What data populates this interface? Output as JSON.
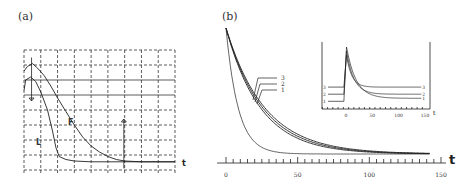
{
  "chart_data": [
    {
      "id": "a",
      "type": "line",
      "panel_label": "(a)",
      "xlabel": "t",
      "ylabel": "",
      "grid": true,
      "x_divisions": 9,
      "y_divisions": 8,
      "xlim": [
        0,
        9
      ],
      "ylim": [
        0,
        8
      ],
      "series": [
        {
          "name": "F",
          "label": "F",
          "points": [
            [
              0,
              6.6
            ],
            [
              0.2,
              6.9
            ],
            [
              0.5,
              7.1
            ],
            [
              0.8,
              6.8
            ],
            [
              1.2,
              6.3
            ],
            [
              1.6,
              5.6
            ],
            [
              2.0,
              4.8
            ],
            [
              2.5,
              3.9
            ],
            [
              3.0,
              3.0
            ],
            [
              3.5,
              2.2
            ],
            [
              4.0,
              1.6
            ],
            [
              4.5,
              1.2
            ],
            [
              5.0,
              0.9
            ],
            [
              5.5,
              0.7
            ],
            [
              6.0,
              0.6
            ],
            [
              7.0,
              0.55
            ],
            [
              8.0,
              0.55
            ],
            [
              9.0,
              0.55
            ]
          ]
        },
        {
          "name": "L",
          "label": "L",
          "points": [
            [
              0,
              5.3
            ],
            [
              0.1,
              6.0
            ],
            [
              0.4,
              6.2
            ],
            [
              0.7,
              5.9
            ],
            [
              1.0,
              5.2
            ],
            [
              1.4,
              4.0
            ],
            [
              1.7,
              2.6
            ],
            [
              1.9,
              1.5
            ],
            [
              2.1,
              0.9
            ],
            [
              2.5,
              0.7
            ],
            [
              3.0,
              0.6
            ],
            [
              4.0,
              0.55
            ],
            [
              6.0,
              0.55
            ],
            [
              9.0,
              0.55
            ]
          ]
        }
      ],
      "annotations": [
        {
          "type": "arrow-down",
          "x": 0.45,
          "y_from": 7.5,
          "y_to": 4.6
        },
        {
          "type": "arrow-up",
          "x": 5.95,
          "y_from": 0.1,
          "y_to": 3.4
        }
      ]
    },
    {
      "id": "b",
      "type": "line",
      "panel_label": "(b)",
      "xlabel": "t",
      "ylabel": "",
      "grid": false,
      "xlim": [
        0,
        150
      ],
      "x_ticks": [
        0,
        50,
        100,
        150
      ],
      "x_tick_labels": [
        "0",
        "50",
        "100",
        "150"
      ],
      "x_minor_tick_step": 5,
      "ylim": [
        0,
        1
      ],
      "series": [
        {
          "name": "1",
          "label": "1",
          "decay": 8.5
        },
        {
          "name": "2",
          "label": "2",
          "decay": 24
        },
        {
          "name": "3",
          "label": "3",
          "decay": 25.5
        },
        {
          "name": "4",
          "label": "",
          "decay": 27
        }
      ],
      "curve_labels": [
        "3",
        "2",
        "1"
      ],
      "inset": {
        "type": "line",
        "xlabel": "t",
        "xlim": [
          -50,
          150
        ],
        "x_ticks": [
          0,
          50,
          100,
          150
        ],
        "x_tick_labels": [
          "0",
          "50",
          "100",
          "150"
        ],
        "series": [
          {
            "name": "1",
            "label": "1",
            "baseline": 0.08,
            "peak": 1.0,
            "final": 0.13
          },
          {
            "name": "2",
            "label": "2",
            "baseline": 0.2,
            "peak": 0.93,
            "final": 0.2
          },
          {
            "name": "3",
            "label": "3",
            "baseline": 0.32,
            "peak": 0.86,
            "final": 0.32
          }
        ],
        "left_labels": [
          "3",
          "2",
          "1"
        ],
        "right_labels": [
          "3",
          "2",
          "1"
        ]
      }
    }
  ],
  "labels": {
    "panel_a": "(a)",
    "panel_b": "(b)",
    "t_a": "t",
    "t_b": "t",
    "t_inset": "t",
    "F": "F",
    "L": "L"
  }
}
